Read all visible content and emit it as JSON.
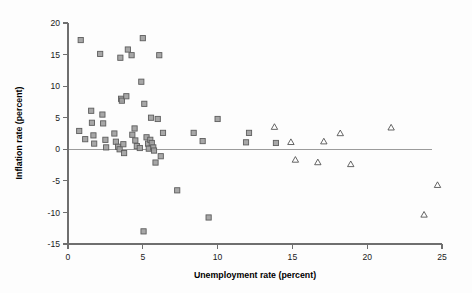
{
  "chart_data": {
    "type": "scatter",
    "title": "",
    "xlabel": "Unemployment rate (percent)",
    "ylabel": "Inflation rate (percent)",
    "xlim": [
      0,
      25
    ],
    "ylim": [
      -15,
      20
    ],
    "xticks": [
      0,
      5,
      10,
      15,
      20,
      25
    ],
    "yticks": [
      -15,
      -10,
      -5,
      0,
      5,
      10,
      15,
      20
    ],
    "xticklabels": [
      "0",
      "5",
      "10",
      "15",
      "20",
      "25"
    ],
    "yticklabels": [
      "-15",
      "-10",
      "-5",
      "0",
      "5",
      "10",
      "15",
      "20"
    ],
    "grid": false,
    "legend": "none",
    "reference_lines": [
      {
        "type": "horizontal",
        "y": 0,
        "x_start": 0,
        "x_end": 24.3,
        "color": "#9b9b9b"
      }
    ],
    "series": [
      {
        "name": "square-markers",
        "marker": "square",
        "fill_color": "#a0a0a0",
        "edge_color": "#5d5d5d",
        "points": [
          [
            0.85,
            17.3
          ],
          [
            0.75,
            2.9
          ],
          [
            1.15,
            1.6
          ],
          [
            1.55,
            6.1
          ],
          [
            1.6,
            4.2
          ],
          [
            1.7,
            2.2
          ],
          [
            1.75,
            0.9
          ],
          [
            2.15,
            15.1
          ],
          [
            2.3,
            5.5
          ],
          [
            2.35,
            4.1
          ],
          [
            2.5,
            1.5
          ],
          [
            2.55,
            0.3
          ],
          [
            3.1,
            2.5
          ],
          [
            3.2,
            1.2
          ],
          [
            3.35,
            0.4
          ],
          [
            3.45,
            0.0
          ],
          [
            3.5,
            14.5
          ],
          [
            3.55,
            8.0
          ],
          [
            3.6,
            7.7
          ],
          [
            3.7,
            0.8
          ],
          [
            3.75,
            -0.6
          ],
          [
            3.9,
            8.4
          ],
          [
            4.0,
            15.8
          ],
          [
            4.25,
            14.9
          ],
          [
            4.3,
            2.3
          ],
          [
            4.45,
            3.3
          ],
          [
            4.5,
            1.4
          ],
          [
            4.6,
            0.5
          ],
          [
            4.8,
            0.2
          ],
          [
            4.9,
            10.7
          ],
          [
            5.0,
            17.6
          ],
          [
            5.05,
            -13.0
          ],
          [
            5.1,
            7.2
          ],
          [
            5.25,
            1.9
          ],
          [
            5.35,
            0.9
          ],
          [
            5.4,
            0.1
          ],
          [
            5.5,
            1.5
          ],
          [
            5.55,
            5.0
          ],
          [
            5.6,
            1.0
          ],
          [
            5.7,
            0.3
          ],
          [
            5.75,
            -0.2
          ],
          [
            5.85,
            -2.1
          ],
          [
            6.0,
            4.8
          ],
          [
            6.1,
            14.9
          ],
          [
            6.2,
            -1.1
          ],
          [
            6.35,
            2.6
          ],
          [
            7.3,
            -6.5
          ],
          [
            8.4,
            2.6
          ],
          [
            9.0,
            1.3
          ],
          [
            9.4,
            -10.8
          ],
          [
            10.0,
            4.8
          ],
          [
            11.9,
            1.1
          ],
          [
            12.1,
            2.6
          ],
          [
            13.9,
            1.0
          ]
        ]
      },
      {
        "name": "triangle-markers",
        "marker": "triangle",
        "fill_color": "none",
        "edge_color": "#4a4a4a",
        "points": [
          [
            13.8,
            3.6
          ],
          [
            14.9,
            1.2
          ],
          [
            15.2,
            -1.6
          ],
          [
            16.7,
            -2.0
          ],
          [
            17.1,
            1.3
          ],
          [
            18.2,
            2.6
          ],
          [
            18.9,
            -2.3
          ],
          [
            21.6,
            3.5
          ],
          [
            23.8,
            -10.3
          ],
          [
            24.7,
            -5.6
          ]
        ]
      }
    ]
  }
}
